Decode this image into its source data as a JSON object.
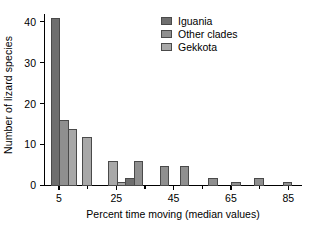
{
  "chart_data": {
    "type": "bar",
    "title": "",
    "xlabel": "Percent time moving (median values)",
    "ylabel": "Number of lizard species",
    "xlim": [
      0,
      90
    ],
    "ylim": [
      0,
      42
    ],
    "grid": false,
    "legend_position": "top-right",
    "xticks": [
      5,
      25,
      45,
      65,
      85
    ],
    "xtick_labels": [
      "5",
      "25",
      "45",
      "65",
      "85"
    ],
    "xminor_ticks": [
      15,
      35,
      55,
      75
    ],
    "yticks": [
      0,
      10,
      20,
      30,
      40
    ],
    "ytick_labels": [
      "0",
      "10",
      "20",
      "30",
      "40"
    ],
    "series": [
      {
        "name": "Iguania",
        "color": "#6e6e6e",
        "points": [
          {
            "x": 4,
            "value": 41
          },
          {
            "x": 30,
            "value": 2
          }
        ]
      },
      {
        "name": "Other clades",
        "color": "#8f8f8f",
        "points": [
          {
            "x": 7,
            "value": 16
          },
          {
            "x": 33,
            "value": 6
          },
          {
            "x": 42,
            "value": 5
          },
          {
            "x": 49,
            "value": 5
          },
          {
            "x": 59,
            "value": 2
          },
          {
            "x": 67,
            "value": 1
          },
          {
            "x": 75,
            "value": 2
          },
          {
            "x": 85,
            "value": 1
          }
        ]
      },
      {
        "name": "Gekkota",
        "color": "#a8a8a8",
        "points": [
          {
            "x": 10,
            "value": 14
          },
          {
            "x": 15,
            "value": 12
          },
          {
            "x": 24,
            "value": 6
          },
          {
            "x": 27,
            "value": 1
          }
        ]
      }
    ]
  },
  "legend": {
    "items": [
      {
        "label": "Iguania",
        "color": "#6e6e6e"
      },
      {
        "label": "Other clades",
        "color": "#8f8f8f"
      },
      {
        "label": "Gekkota",
        "color": "#a8a8a8"
      }
    ]
  }
}
